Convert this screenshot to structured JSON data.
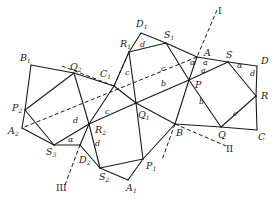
{
  "figure": {
    "vertices": {
      "D1": {
        "label": "D",
        "sub": "1",
        "x": 141,
        "y": 33,
        "lx": 136,
        "ly": 27
      },
      "S1": {
        "label": "S",
        "sub": "1",
        "x": 166,
        "y": 43,
        "lx": 164,
        "ly": 38
      },
      "A": {
        "label": "A",
        "sub": "",
        "x": 197,
        "y": 57,
        "lx": 204,
        "ly": 56
      },
      "S": {
        "label": "S",
        "sub": "",
        "x": 228,
        "y": 62,
        "lx": 226,
        "ly": 58
      },
      "D": {
        "label": "D",
        "sub": "",
        "x": 257,
        "y": 66,
        "lx": 261,
        "ly": 64
      },
      "R": {
        "label": "R",
        "sub": "",
        "x": 256,
        "y": 96,
        "lx": 261,
        "ly": 99
      },
      "C": {
        "label": "C",
        "sub": "",
        "x": 257,
        "y": 130,
        "lx": 258,
        "ly": 140
      },
      "Q": {
        "label": "Q",
        "sub": "",
        "x": 221,
        "y": 127,
        "lx": 218,
        "ly": 138
      },
      "B": {
        "label": "B",
        "sub": "",
        "x": 175,
        "y": 124,
        "lx": 176,
        "ly": 136
      },
      "P": {
        "label": "P",
        "sub": "",
        "x": 189,
        "y": 80,
        "lx": 195,
        "ly": 88
      },
      "R1": {
        "label": "R",
        "sub": "1",
        "x": 129,
        "y": 52,
        "lx": 120,
        "ly": 47
      },
      "C1": {
        "label": "C",
        "sub": "1",
        "x": 114,
        "y": 86,
        "lx": 100,
        "ly": 77
      },
      "Q2": {
        "label": "Q",
        "sub": "2",
        "x": 74,
        "y": 73,
        "lx": 70,
        "ly": 70
      },
      "B1": {
        "label": "B",
        "sub": "1",
        "x": 31,
        "y": 65,
        "lx": 20,
        "ly": 61
      },
      "P2": {
        "label": "P",
        "sub": "2",
        "x": 25,
        "y": 110,
        "lx": 12,
        "ly": 111
      },
      "A2": {
        "label": "A",
        "sub": "2",
        "x": 22,
        "y": 128,
        "lx": 8,
        "ly": 134
      },
      "S3": {
        "label": "S",
        "sub": "3",
        "x": 54,
        "y": 145,
        "lx": 46,
        "ly": 155
      },
      "D2": {
        "label": "D",
        "sub": "2",
        "x": 80,
        "y": 145,
        "lx": 79,
        "ly": 163
      },
      "R2": {
        "label": "R",
        "sub": "2",
        "x": 89,
        "y": 124,
        "lx": 95,
        "ly": 133
      },
      "S2": {
        "label": "S",
        "sub": "2",
        "x": 100,
        "y": 168,
        "lx": 99,
        "ly": 180
      },
      "A1": {
        "label": "A",
        "sub": "1",
        "x": 128,
        "y": 180,
        "lx": 126,
        "ly": 191
      },
      "P1": {
        "label": "P",
        "sub": "1",
        "x": 143,
        "y": 159,
        "lx": 146,
        "ly": 169
      },
      "Q1": {
        "label": "Q",
        "sub": "1",
        "x": 136,
        "y": 103,
        "lx": 138,
        "ly": 118
      }
    },
    "solid_edges": [
      [
        "D1",
        "S1"
      ],
      [
        "S1",
        "A"
      ],
      [
        "A",
        "S"
      ],
      [
        "S",
        "D"
      ],
      [
        "D",
        "R"
      ],
      [
        "R",
        "C"
      ],
      [
        "C",
        "Q"
      ],
      [
        "Q",
        "B"
      ],
      [
        "B",
        "P1"
      ],
      [
        "P1",
        "A1"
      ],
      [
        "A1",
        "S2"
      ],
      [
        "S2",
        "D2"
      ],
      [
        "D2",
        "S3"
      ],
      [
        "S3",
        "A2"
      ],
      [
        "A2",
        "P2"
      ],
      [
        "P2",
        "B1"
      ],
      [
        "B1",
        "Q2"
      ],
      [
        "Q2",
        "C1"
      ],
      [
        "C1",
        "Q1"
      ],
      [
        "Q1",
        "B"
      ],
      [
        "C1",
        "R1"
      ],
      [
        "R1",
        "D1"
      ],
      [
        "R1",
        "S1"
      ],
      [
        "S1",
        "P"
      ],
      [
        "P",
        "Q"
      ],
      [
        "A",
        "P"
      ],
      [
        "P",
        "B"
      ],
      [
        "Q1",
        "P"
      ],
      [
        "P",
        "S"
      ],
      [
        "S",
        "R"
      ],
      [
        "R",
        "Q"
      ],
      [
        "R1",
        "Q1"
      ],
      [
        "Q1",
        "P1"
      ],
      [
        "S2",
        "P1"
      ],
      [
        "Q1",
        "R2"
      ],
      [
        "R2",
        "C1"
      ],
      [
        "Q2",
        "P2"
      ],
      [
        "Q2",
        "R2"
      ],
      [
        "R2",
        "S2"
      ],
      [
        "P2",
        "S3"
      ],
      [
        "S3",
        "R2"
      ],
      [
        "R2",
        "D2"
      ]
    ],
    "dashed_lines": [
      {
        "name": "axis-I",
        "x1": 217,
        "y1": 10,
        "x2": 197,
        "y2": 57
      },
      {
        "name": "axis-A-A2",
        "x1": 197,
        "y1": 57,
        "x2": 22,
        "y2": 128
      },
      {
        "name": "axis-II",
        "x1": 175,
        "y1": 124,
        "x2": 226,
        "y2": 146
      },
      {
        "name": "axis-B-down",
        "x1": 175,
        "y1": 124,
        "x2": 162,
        "y2": 160
      },
      {
        "name": "axis-III",
        "x1": 65,
        "y1": 185,
        "x2": 80,
        "y2": 145
      },
      {
        "name": "axis-C1-R1",
        "x1": 114,
        "y1": 86,
        "x2": 129,
        "y2": 52
      },
      {
        "name": "axis-Q2-C1",
        "x1": 62,
        "y1": 66,
        "x2": 114,
        "y2": 86
      }
    ],
    "axis_labels": [
      {
        "text": "I",
        "x": 218,
        "y": 14
      },
      {
        "text": "II",
        "x": 226,
        "y": 152
      },
      {
        "text": "III",
        "x": 56,
        "y": 191
      }
    ],
    "side_labels": [
      {
        "text": "d",
        "x": 140,
        "y": 47
      },
      {
        "text": "d",
        "x": 250,
        "y": 76
      },
      {
        "text": "a",
        "x": 203,
        "y": 65
      },
      {
        "text": "a",
        "x": 201,
        "y": 73
      },
      {
        "text": "α",
        "x": 237,
        "y": 68
      },
      {
        "text": "α",
        "x": 190,
        "y": 65
      },
      {
        "text": "c",
        "x": 125,
        "y": 75
      },
      {
        "text": "c",
        "x": 161,
        "y": 71
      },
      {
        "text": "b",
        "x": 161,
        "y": 86
      },
      {
        "text": "b",
        "x": 199,
        "y": 104
      },
      {
        "text": "c",
        "x": 233,
        "y": 116
      },
      {
        "text": "c",
        "x": 105,
        "y": 114
      },
      {
        "text": "d",
        "x": 73,
        "y": 123
      },
      {
        "text": "d",
        "x": 95,
        "y": 146
      },
      {
        "text": "α",
        "x": 68,
        "y": 142
      }
    ]
  }
}
